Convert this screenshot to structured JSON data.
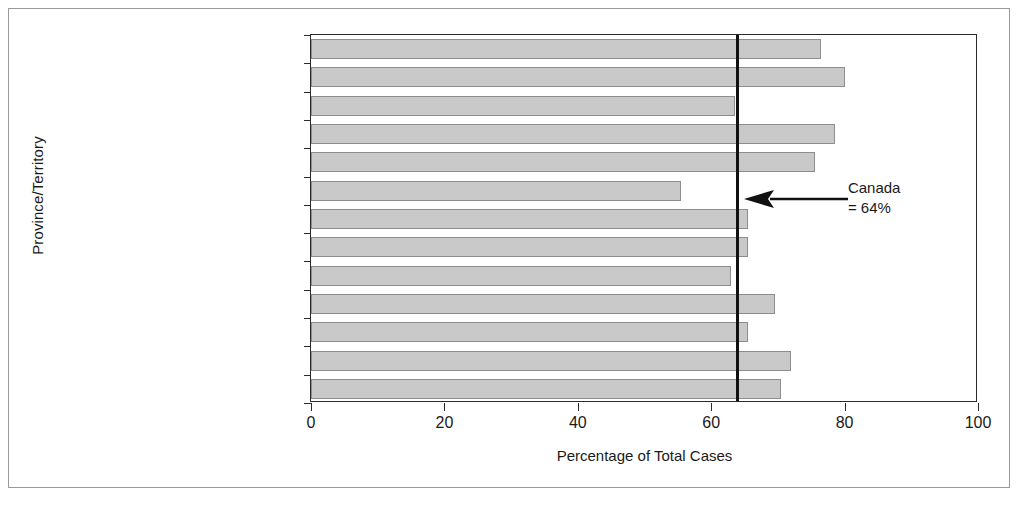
{
  "figure": {
    "background": "#ffffff",
    "border_color": "#9a9a9a",
    "bar_fill": "#c9c9c9",
    "bar_stroke": "#8d8d8d",
    "axis_color": "#2b2b2b",
    "reference_line_color": "#111111"
  },
  "annotation": {
    "line1": "Canada",
    "line2": "= 64%",
    "arrow": "left-arrow-icon"
  },
  "chart_data": {
    "type": "bar",
    "orientation": "horizontal",
    "title": "",
    "xlabel": "Percentage of Total Cases",
    "ylabel": "Province/Territory",
    "xlim": [
      0,
      100
    ],
    "xticks": [
      0,
      20,
      40,
      60,
      80,
      100
    ],
    "xtick_labels": [
      "0",
      "20",
      "40",
      "60",
      "80",
      "100"
    ],
    "grid": false,
    "legend": null,
    "reference_line": {
      "label": "Canada",
      "value": 64,
      "value_label": "= 64%"
    },
    "categories": [
      "Newfoundland and Labrador",
      "Prince Edward Island",
      "Nova Scotia",
      "New Brunswick",
      "Quebec",
      "Ontario",
      "Manitoba",
      "Saskatchewan",
      "Alberta",
      "British Columbia",
      "Yukon",
      "Northwest Territories",
      "Nunavut"
    ],
    "values": [
      76.5,
      80,
      63.5,
      78.5,
      75.5,
      55.5,
      65.5,
      65.5,
      63,
      69.5,
      65.5,
      72,
      70.5
    ]
  }
}
